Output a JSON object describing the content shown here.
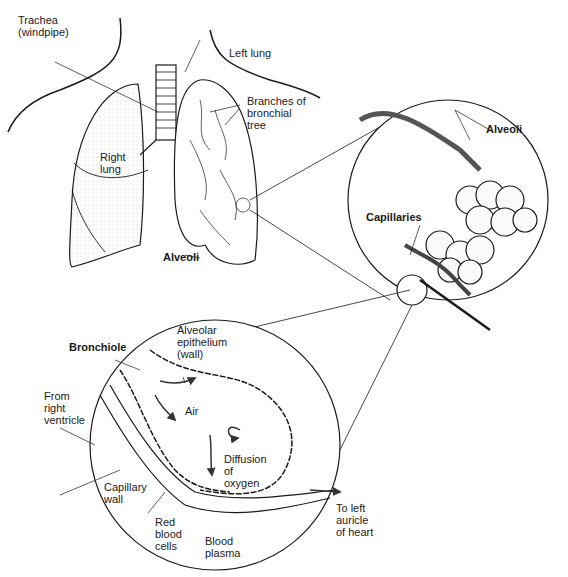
{
  "figure": {
    "colors": {
      "ink": "#1a1a1a",
      "background": "#ffffff",
      "stipple": "#c8c8c8"
    }
  },
  "labels": {
    "trachea": "Trachea\n(windpipe)",
    "left_lung": "Left lung",
    "branches": "Branches of\nbronchial\ntree",
    "right_lung": "Right\nlung",
    "alveoli_lung": "Alveoli",
    "alveoli_zoom": "Alveoli",
    "capillaries": "Capillaries",
    "bronchiole": "Bronchiole",
    "alveolar_epithelium": "Alveolar\nepithelium\n(wall)",
    "from_right_ventricle": "From\nright\nventricle",
    "air": "Air",
    "diffusion": "Diffusion\nof\noxygen",
    "capillary_wall": "Capillary\nwall",
    "red_blood_cells": "Red\nblood\ncells",
    "blood_plasma": "Blood\nplasma",
    "to_left_auricle": "To left\nauricle\nof heart"
  }
}
